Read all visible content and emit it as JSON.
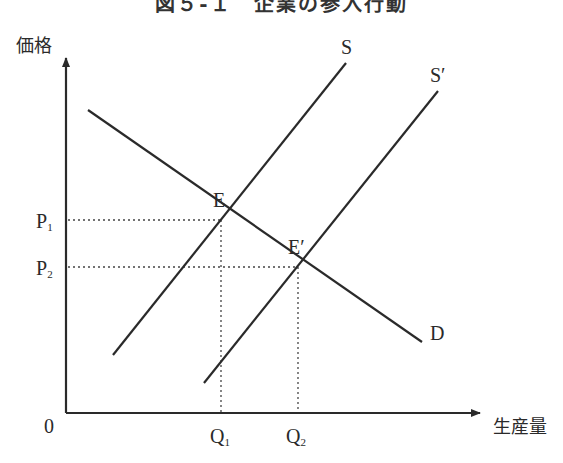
{
  "title": "図５-１　企業の参入行動",
  "axes": {
    "y_label": "価格",
    "x_label": "生産量",
    "origin_label": "0"
  },
  "curves": {
    "demand": "D",
    "supply": "S",
    "supply_shifted": "S′"
  },
  "points": {
    "equilibrium": "E",
    "equilibrium_shifted": "E′"
  },
  "ticks": {
    "p1": {
      "base": "P",
      "sub": "1"
    },
    "p2": {
      "base": "P",
      "sub": "2"
    },
    "q1": {
      "base": "Q",
      "sub": "1"
    },
    "q2": {
      "base": "Q",
      "sub": "2"
    }
  },
  "colors": {
    "line": "#2a2a2a",
    "guide": "#444444",
    "background": "#ffffff"
  }
}
